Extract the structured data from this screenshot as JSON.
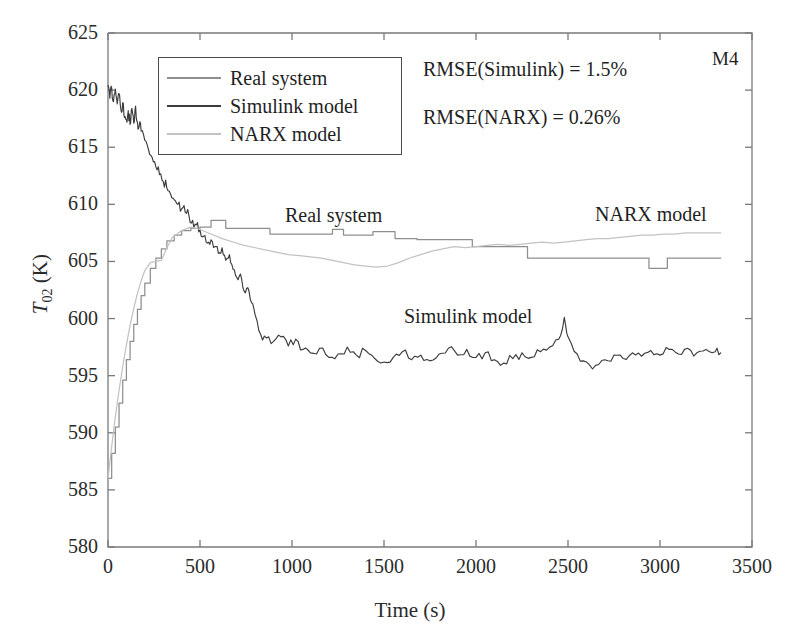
{
  "figure": {
    "corner_tag": "M4",
    "background": "#ffffff"
  },
  "axes": {
    "x_title": "Time (s)",
    "y_title_symbol": "T",
    "y_title_subscript": "02",
    "y_title_unit": " (K)",
    "x_ticks": [
      "0",
      "500",
      "1000",
      "1500",
      "2000",
      "2500",
      "3000",
      "3500"
    ],
    "y_ticks": [
      "580",
      "585",
      "590",
      "595",
      "600",
      "605",
      "610",
      "615",
      "620",
      "625"
    ],
    "axis_color": "#7a7a7a"
  },
  "legend": {
    "entries": [
      {
        "label": "Real system",
        "color": "#8e8e8e"
      },
      {
        "label": "Simulink model",
        "color": "#3c3c3c"
      },
      {
        "label": "NARX model",
        "color": "#c2c2c2"
      }
    ]
  },
  "annotations": {
    "rmse_simulink": "RMSE(Simulink) = 1.5%",
    "rmse_narx": "RMSE(NARX) = 0.26%",
    "curve_label_real": "Real system",
    "curve_label_narx": "NARX model",
    "curve_label_simulink": "Simulink model"
  },
  "chart_data": {
    "type": "line",
    "title": "",
    "subtitle": "",
    "xlabel": "Time (s)",
    "ylabel": "T02 (K)",
    "xlim": [
      0,
      3500
    ],
    "ylim": [
      580,
      625
    ],
    "xticks": [
      0,
      500,
      1000,
      1500,
      2000,
      2500,
      3000,
      3500
    ],
    "yticks": [
      580,
      585,
      590,
      595,
      600,
      605,
      610,
      615,
      620,
      625
    ],
    "grid": false,
    "legend_position": "upper-left-inside",
    "annotations": [
      "RMSE(Simulink) = 1.5%",
      "RMSE(NARX) = 0.26%",
      "M4"
    ],
    "series": [
      {
        "name": "Real system",
        "color": "#8e8e8e",
        "style": "stepped",
        "x": [
          0,
          20,
          40,
          60,
          80,
          100,
          120,
          140,
          160,
          180,
          200,
          230,
          260,
          290,
          320,
          360,
          400,
          450,
          500,
          540,
          560,
          600,
          640,
          700,
          760,
          820,
          880,
          940,
          1000,
          1060,
          1120,
          1180,
          1220,
          1250,
          1280,
          1320,
          1380,
          1440,
          1500,
          1560,
          1620,
          1680,
          1740,
          1800,
          1860,
          1920,
          1980,
          2040,
          2100,
          2160,
          2220,
          2280,
          2340,
          2400,
          2460,
          2520,
          2580,
          2700,
          2820,
          2900,
          2940,
          2990,
          3040,
          3100,
          3200,
          3330
        ],
        "y": [
          586.0,
          588.2,
          590.5,
          592.6,
          594.6,
          596.4,
          598.0,
          599.5,
          600.8,
          602.0,
          603.1,
          604.4,
          605.3,
          606.1,
          606.8,
          607.3,
          607.7,
          607.9,
          608.0,
          608.0,
          608.6,
          608.6,
          607.9,
          607.9,
          607.9,
          607.9,
          607.4,
          607.4,
          607.4,
          607.4,
          607.4,
          607.4,
          607.8,
          607.8,
          607.3,
          607.3,
          607.3,
          607.6,
          607.6,
          607.0,
          607.0,
          606.9,
          606.9,
          606.9,
          606.9,
          606.9,
          606.3,
          606.3,
          606.3,
          606.3,
          606.3,
          605.3,
          605.3,
          605.3,
          605.3,
          605.3,
          605.3,
          605.3,
          605.3,
          605.3,
          604.4,
          604.4,
          605.3,
          605.3,
          605.3,
          605.3
        ]
      },
      {
        "name": "Simulink model",
        "color": "#3c3c3c",
        "style": "noisy",
        "x": [
          0,
          10,
          20,
          30,
          40,
          50,
          60,
          70,
          80,
          90,
          100,
          110,
          120,
          130,
          140,
          150,
          160,
          170,
          180,
          200,
          220,
          240,
          260,
          280,
          300,
          320,
          340,
          360,
          380,
          400,
          420,
          440,
          460,
          480,
          500,
          520,
          540,
          560,
          580,
          600,
          620,
          640,
          660,
          680,
          700,
          720,
          740,
          760,
          780,
          800,
          830,
          860,
          900,
          940,
          980,
          1020,
          1060,
          1100,
          1150,
          1200,
          1250,
          1300,
          1350,
          1400,
          1450,
          1500,
          1550,
          1600,
          1650,
          1700,
          1750,
          1800,
          1850,
          1900,
          1950,
          2000,
          2050,
          2100,
          2150,
          2200,
          2250,
          2300,
          2350,
          2400,
          2450,
          2480,
          2500,
          2550,
          2600,
          2650,
          2700,
          2750,
          2800,
          2850,
          2900,
          2950,
          3000,
          3050,
          3100,
          3150,
          3200,
          3250,
          3300,
          3330
        ],
        "y": [
          620.4,
          619.3,
          620.2,
          619.0,
          620.1,
          618.8,
          619.7,
          618.3,
          618.9,
          617.6,
          617.4,
          618.2,
          617.0,
          618.4,
          617.1,
          618.6,
          617.2,
          616.9,
          616.4,
          615.6,
          614.8,
          614.1,
          613.3,
          612.6,
          612.0,
          611.4,
          610.9,
          610.4,
          610.0,
          609.6,
          609.3,
          609.0,
          608.6,
          608.2,
          607.8,
          607.2,
          606.6,
          606.9,
          606.3,
          605.7,
          606.2,
          605.1,
          605.6,
          604.3,
          603.6,
          603.9,
          602.4,
          602.7,
          601.4,
          600.3,
          598.6,
          598.3,
          598.0,
          598.4,
          597.6,
          598.2,
          597.3,
          597.0,
          597.4,
          596.6,
          596.9,
          597.5,
          596.8,
          597.2,
          596.5,
          596.2,
          596.6,
          597.1,
          596.4,
          596.8,
          596.3,
          596.9,
          597.4,
          596.8,
          597.3,
          596.6,
          597.0,
          596.4,
          596.1,
          596.5,
          597.0,
          596.6,
          597.1,
          597.5,
          598.2,
          600.1,
          598.4,
          596.9,
          596.2,
          595.9,
          596.4,
          596.8,
          596.5,
          597.0,
          596.7,
          597.2,
          596.8,
          597.3,
          596.9,
          597.4,
          597.0,
          597.3,
          597.1,
          597.0
        ]
      },
      {
        "name": "NARX model",
        "color": "#c2c2c2",
        "style": "smooth",
        "x": [
          0,
          20,
          40,
          60,
          80,
          100,
          120,
          140,
          160,
          180,
          200,
          230,
          260,
          290,
          320,
          350,
          400,
          450,
          500,
          560,
          620,
          680,
          740,
          800,
          860,
          920,
          980,
          1040,
          1100,
          1160,
          1220,
          1280,
          1340,
          1400,
          1460,
          1520,
          1580,
          1640,
          1700,
          1760,
          1820,
          1880,
          1940,
          2000,
          2060,
          2120,
          2180,
          2240,
          2300,
          2360,
          2420,
          2480,
          2540,
          2600,
          2660,
          2720,
          2780,
          2840,
          2900,
          2960,
          3020,
          3080,
          3140,
          3200,
          3260,
          3330
        ],
        "y": [
          586.0,
          588.8,
          591.4,
          593.7,
          595.8,
          597.7,
          599.4,
          600.9,
          602.2,
          603.3,
          604.2,
          604.9,
          605.0,
          605.1,
          606.2,
          607.1,
          607.7,
          608.0,
          607.8,
          607.4,
          607.0,
          606.7,
          606.4,
          606.2,
          606.0,
          605.8,
          605.6,
          605.5,
          605.4,
          605.3,
          605.1,
          604.9,
          604.7,
          604.6,
          604.5,
          604.6,
          604.9,
          605.3,
          605.6,
          605.9,
          606.1,
          606.3,
          606.2,
          606.3,
          606.4,
          606.5,
          606.4,
          606.5,
          606.6,
          606.7,
          606.6,
          606.7,
          606.8,
          606.9,
          607.0,
          607.0,
          607.1,
          607.2,
          607.3,
          607.3,
          607.4,
          607.4,
          607.5,
          607.5,
          607.5,
          607.5
        ]
      }
    ]
  }
}
